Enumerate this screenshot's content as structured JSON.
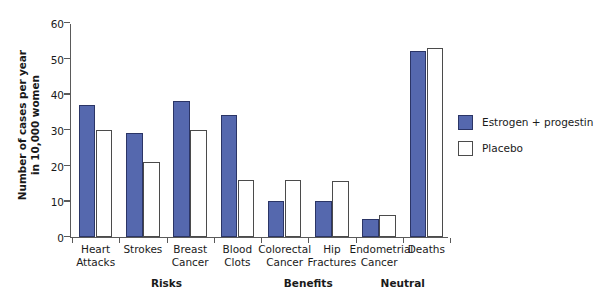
{
  "chart_data": {
    "type": "bar",
    "title": "",
    "subtitle": "",
    "xlabel": "",
    "ylabel": "Number of cases per year\nin 10,000 women",
    "ylim": [
      0,
      60
    ],
    "yticks": [
      0,
      10,
      20,
      30,
      40,
      50,
      60
    ],
    "ytick_labels": [
      "0",
      "10",
      "20",
      "30",
      "40",
      "50",
      "60"
    ],
    "grid": false,
    "legend_position": "right",
    "categories": [
      "Heart\nAttacks",
      "Strokes",
      "Breast\nCancer",
      "Blood\nClots",
      "Colorectal\nCancer",
      "Hip\nFractures",
      "Endometrial\nCancer",
      "Deaths"
    ],
    "series": [
      {
        "name": "Estrogen + progestin",
        "color": "#5568ae",
        "values": [
          37,
          29,
          38,
          34,
          10,
          10,
          5,
          52
        ]
      },
      {
        "name": "Placebo",
        "color": "#ffffff",
        "values": [
          30,
          21,
          30,
          16,
          16,
          15.5,
          6,
          53
        ]
      }
    ],
    "group_annotations": [
      {
        "label": "Risks",
        "start_category": 0,
        "end_category": 3
      },
      {
        "label": "Benefits",
        "start_category": 4,
        "end_category": 5
      },
      {
        "label": "Neutral",
        "start_category": 6,
        "end_category": 7
      }
    ]
  },
  "colors": {
    "series_blue": "#5568ae",
    "series_blue_outline": "#2b3566",
    "series_white": "#ffffff",
    "series_white_outline": "#4b4b4b",
    "axis": "#5a5a5a",
    "text": "#1a1a1a",
    "background": "#ffffff"
  }
}
